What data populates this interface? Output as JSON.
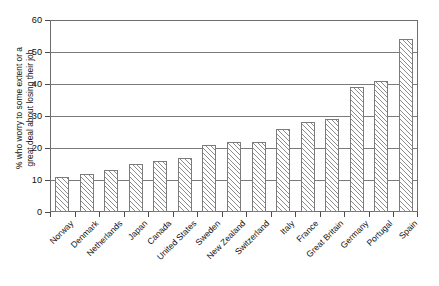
{
  "chart_data": {
    "type": "bar",
    "title": "",
    "xlabel": "",
    "ylabel": "% who worry to some extent or a great deal about losing their job",
    "ylabel_lines": [
      "% who worry to some extent or a",
      "great deal about losing their job"
    ],
    "ylim": [
      0,
      60
    ],
    "ytick_step": 10,
    "yticks": [
      0,
      10,
      20,
      30,
      40,
      50,
      60
    ],
    "ytick_labels": [
      "0",
      "10",
      "20",
      "30",
      "40",
      "50",
      "60"
    ],
    "grid": true,
    "grid_axis": "y",
    "legend": false,
    "legend_position": "none",
    "bar_style": {
      "fill": "#ffffff",
      "hatch": "diagonal-forward",
      "edge_color": "#7b7b7b"
    },
    "categories": [
      "Norway",
      "Denmark",
      "Netherlands",
      "Japan",
      "Canada",
      "United States",
      "Sweden",
      "New Zealand",
      "Switzerland",
      "Italy",
      "France",
      "Great Britain",
      "Germany",
      "Portugal",
      "Spain"
    ],
    "values": [
      11,
      12,
      13,
      15,
      16,
      17,
      21,
      22,
      22,
      26,
      28,
      29,
      39,
      41,
      54
    ],
    "xtick_label_rotation": -45
  }
}
